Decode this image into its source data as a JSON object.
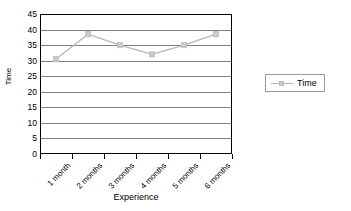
{
  "chart_data": {
    "type": "line",
    "title": "",
    "xlabel": "Experience",
    "ylabel": "Time",
    "categories": [
      "1 month",
      "2 months",
      "3 months",
      "4 months",
      "5 months",
      "6 months"
    ],
    "series": [
      {
        "name": "Time",
        "values": [
          30.5,
          38.5,
          35,
          32,
          35,
          38.5
        ]
      }
    ],
    "ylim": [
      0,
      45
    ],
    "yticks": [
      0,
      5,
      10,
      15,
      20,
      25,
      30,
      35,
      40,
      45
    ],
    "ytick_labels": [
      "0",
      "5",
      "10",
      "15",
      "20",
      "25",
      "30",
      "35",
      "40",
      "45"
    ],
    "grid": "horizontal",
    "legend_position": "right",
    "legend_entries": [
      "Time"
    ],
    "colors": {
      "series_line": "#b6b6b6",
      "series_marker": "#c9c9c9",
      "gridline": "#808080",
      "axis": "#000000",
      "background": "#ffffff"
    }
  }
}
